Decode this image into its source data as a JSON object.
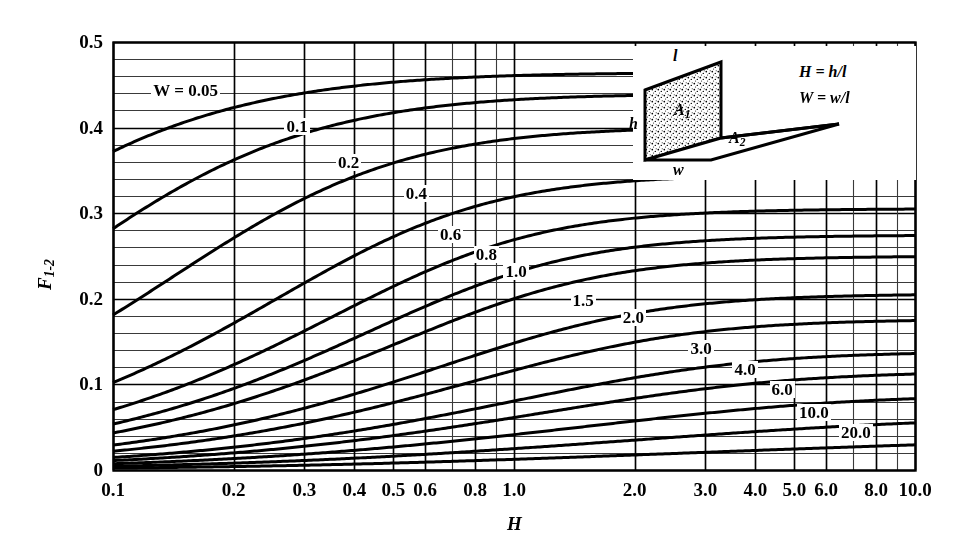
{
  "chart_data": {
    "type": "line",
    "title": "",
    "xlabel": "H",
    "ylabel": "F1-2",
    "ylabel_display": "F",
    "ylabel_sub": "1-2",
    "xscale": "log",
    "yscale": "linear",
    "xlim": [
      0.1,
      10.0
    ],
    "ylim": [
      0.0,
      0.5
    ],
    "grid": true,
    "legend_position": "inline-curve-labels",
    "xticks": [
      0.1,
      0.2,
      0.3,
      0.4,
      0.5,
      0.6,
      0.8,
      1.0,
      2.0,
      3.0,
      4.0,
      5.0,
      6.0,
      8.0,
      10.0
    ],
    "xticklabels": [
      "0.1",
      "0.2",
      "0.3",
      "0.4",
      "0.5",
      "0.6",
      "0.8",
      "1.0",
      "2.0",
      "3.0",
      "4.0",
      "5.0",
      "6.0",
      "8.0",
      "10.0"
    ],
    "yticks": [
      0,
      0.1,
      0.2,
      0.3,
      0.4,
      0.5
    ],
    "yticklabels": [
      "0",
      "0.1",
      "0.2",
      "0.3",
      "0.4",
      "0.5"
    ],
    "y_minor_step": 0.02,
    "series": [
      {
        "name": "W = 0.05",
        "W": 0.05,
        "label": "W = 0.05",
        "label_x": 0.148,
        "label_y": 0.442,
        "x": [
          0.1,
          0.15,
          0.2,
          0.3,
          0.4,
          0.5,
          0.6,
          0.8,
          1.0,
          1.5,
          2.0,
          3.0,
          4.0,
          6.0,
          10.0
        ],
        "y": [
          0.379,
          0.409,
          0.425,
          0.442,
          0.45,
          0.455,
          0.457,
          0.46,
          0.461,
          0.462,
          0.462,
          0.462,
          0.462,
          0.462,
          0.462
        ]
      },
      {
        "name": "0.1",
        "W": 0.1,
        "label": "0.1",
        "label_x": 0.29,
        "label_y": 0.4,
        "x": [
          0.1,
          0.15,
          0.2,
          0.3,
          0.4,
          0.5,
          0.6,
          0.8,
          1.0,
          1.5,
          2.0,
          3.0,
          4.0,
          6.0,
          10.0
        ],
        "y": [
          0.288,
          0.34,
          0.371,
          0.405,
          0.421,
          0.43,
          0.436,
          0.441,
          0.444,
          0.446,
          0.447,
          0.447,
          0.447,
          0.447,
          0.447
        ]
      },
      {
        "name": "0.2",
        "W": 0.2,
        "label": "0.2",
        "label_x": 0.39,
        "label_y": 0.357,
        "x": [
          0.1,
          0.15,
          0.2,
          0.3,
          0.4,
          0.5,
          0.6,
          0.8,
          1.0,
          1.5,
          2.0,
          3.0,
          4.0,
          6.0,
          10.0
        ],
        "y": [
          0.187,
          0.238,
          0.278,
          0.33,
          0.358,
          0.375,
          0.385,
          0.396,
          0.4,
          0.405,
          0.406,
          0.407,
          0.407,
          0.407,
          0.407
        ]
      },
      {
        "name": "0.4",
        "W": 0.4,
        "label": "0.4",
        "label_x": 0.575,
        "label_y": 0.321,
        "x": [
          0.1,
          0.15,
          0.2,
          0.3,
          0.4,
          0.5,
          0.6,
          0.8,
          1.0,
          1.5,
          2.0,
          3.0,
          4.0,
          6.0,
          10.0
        ],
        "y": [
          0.104,
          0.141,
          0.172,
          0.223,
          0.258,
          0.283,
          0.3,
          0.321,
          0.331,
          0.341,
          0.344,
          0.346,
          0.347,
          0.347,
          0.347
        ]
      },
      {
        "name": "0.6",
        "W": 0.6,
        "label": "0.6",
        "label_x": 0.7,
        "label_y": 0.273,
        "x": [
          0.1,
          0.15,
          0.2,
          0.3,
          0.4,
          0.5,
          0.6,
          0.8,
          1.0,
          1.5,
          2.0,
          3.0,
          4.0,
          6.0,
          10.0
        ],
        "y": [
          0.07,
          0.097,
          0.12,
          0.161,
          0.192,
          0.216,
          0.234,
          0.259,
          0.274,
          0.291,
          0.297,
          0.301,
          0.303,
          0.303,
          0.303
        ]
      },
      {
        "name": "0.8",
        "W": 0.8,
        "label": "0.8",
        "label_x": 0.86,
        "label_y": 0.25,
        "x": [
          0.1,
          0.15,
          0.2,
          0.3,
          0.4,
          0.5,
          0.6,
          0.8,
          1.0,
          1.5,
          2.0,
          3.0,
          4.0,
          6.0,
          10.0
        ],
        "y": [
          0.052,
          0.073,
          0.091,
          0.124,
          0.151,
          0.172,
          0.189,
          0.215,
          0.233,
          0.256,
          0.265,
          0.272,
          0.274,
          0.275,
          0.275
        ]
      },
      {
        "name": "1.0",
        "W": 1.0,
        "label": "1.0",
        "label_x": 1.02,
        "label_y": 0.23,
        "x": [
          0.1,
          0.15,
          0.2,
          0.3,
          0.4,
          0.5,
          0.6,
          0.8,
          1.0,
          1.5,
          2.0,
          3.0,
          4.0,
          6.0,
          10.0
        ],
        "y": [
          0.042,
          0.059,
          0.074,
          0.101,
          0.124,
          0.143,
          0.159,
          0.184,
          0.2,
          0.226,
          0.238,
          0.247,
          0.251,
          0.253,
          0.254
        ]
      },
      {
        "name": "1.5",
        "W": 1.5,
        "label": "1.5",
        "label_x": 1.5,
        "label_y": 0.196,
        "x": [
          0.1,
          0.15,
          0.2,
          0.3,
          0.4,
          0.5,
          0.6,
          0.8,
          1.0,
          1.5,
          2.0,
          3.0,
          4.0,
          6.0,
          10.0
        ],
        "y": [
          0.028,
          0.04,
          0.05,
          0.07,
          0.087,
          0.101,
          0.114,
          0.135,
          0.152,
          0.18,
          0.195,
          0.211,
          0.217,
          0.221,
          0.223
        ]
      },
      {
        "name": "2.0",
        "W": 2.0,
        "label": "2.0",
        "label_x": 2.0,
        "label_y": 0.176,
        "x": [
          0.1,
          0.15,
          0.2,
          0.3,
          0.4,
          0.5,
          0.6,
          0.8,
          1.0,
          1.5,
          2.0,
          3.0,
          4.0,
          6.0,
          10.0
        ],
        "y": [
          0.021,
          0.03,
          0.038,
          0.053,
          0.067,
          0.078,
          0.088,
          0.106,
          0.121,
          0.147,
          0.163,
          0.182,
          0.191,
          0.198,
          0.201
        ]
      },
      {
        "name": "3.0",
        "W": 3.0,
        "label": "3.0",
        "label_x": 2.95,
        "label_y": 0.14,
        "x": [
          0.1,
          0.15,
          0.2,
          0.3,
          0.4,
          0.5,
          0.6,
          0.8,
          1.0,
          1.5,
          2.0,
          3.0,
          4.0,
          6.0,
          10.0
        ],
        "y": [
          0.014,
          0.02,
          0.026,
          0.036,
          0.046,
          0.054,
          0.062,
          0.076,
          0.087,
          0.109,
          0.124,
          0.144,
          0.156,
          0.167,
          0.174
        ]
      },
      {
        "name": "4.0",
        "W": 4.0,
        "label": "4.0",
        "label_x": 3.8,
        "label_y": 0.116,
        "x": [
          0.1,
          0.15,
          0.2,
          0.3,
          0.4,
          0.5,
          0.6,
          0.8,
          1.0,
          1.5,
          2.0,
          3.0,
          4.0,
          6.0,
          10.0
        ],
        "y": [
          0.011,
          0.015,
          0.019,
          0.028,
          0.035,
          0.042,
          0.048,
          0.059,
          0.068,
          0.087,
          0.1,
          0.119,
          0.131,
          0.145,
          0.156
        ]
      },
      {
        "name": "6.0",
        "W": 6.0,
        "label": "6.0",
        "label_x": 4.7,
        "label_y": 0.092,
        "x": [
          0.1,
          0.15,
          0.2,
          0.3,
          0.4,
          0.5,
          0.6,
          0.8,
          1.0,
          1.5,
          2.0,
          3.0,
          4.0,
          6.0,
          10.0
        ],
        "y": [
          0.007,
          0.01,
          0.013,
          0.019,
          0.024,
          0.029,
          0.033,
          0.041,
          0.048,
          0.062,
          0.073,
          0.089,
          0.1,
          0.115,
          0.128
        ]
      },
      {
        "name": "10.0",
        "W": 10.0,
        "label": "10.0",
        "label_x": 5.5,
        "label_y": 0.066,
        "x": [
          0.1,
          0.15,
          0.2,
          0.3,
          0.4,
          0.5,
          0.6,
          0.8,
          1.0,
          1.5,
          2.0,
          3.0,
          4.0,
          6.0,
          10.0
        ],
        "y": [
          0.004,
          0.006,
          0.008,
          0.012,
          0.015,
          0.018,
          0.021,
          0.026,
          0.03,
          0.04,
          0.047,
          0.06,
          0.069,
          0.082,
          0.096
        ]
      },
      {
        "name": "20.0",
        "W": 20.0,
        "label": "20.0",
        "label_x": 7.0,
        "label_y": 0.042,
        "x": [
          0.1,
          0.15,
          0.2,
          0.3,
          0.4,
          0.5,
          0.6,
          0.8,
          1.0,
          1.5,
          2.0,
          3.0,
          4.0,
          6.0,
          10.0
        ],
        "y": [
          0.002,
          0.003,
          0.004,
          0.006,
          0.008,
          0.009,
          0.011,
          0.014,
          0.016,
          0.021,
          0.025,
          0.032,
          0.038,
          0.047,
          0.058
        ]
      }
    ]
  },
  "inset": {
    "name": "perpendicular-rectangles-diagram",
    "label_l": "l",
    "label_h": "h",
    "label_w": "w",
    "label_a1": "A",
    "label_a1_sub": "1",
    "label_a2": "A",
    "label_a2_sub": "2",
    "formula_h": "H = h/l",
    "formula_w": "W = w/l"
  },
  "colors": {
    "line": "#000000",
    "grid_major": "#000000",
    "grid_minor": "#3a3a3a",
    "background": "#ffffff"
  }
}
